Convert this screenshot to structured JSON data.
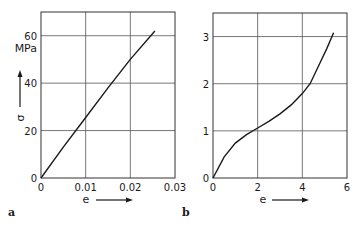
{
  "chart_data": [
    {
      "type": "line",
      "panel_label": "a",
      "title": "",
      "xlabel": "e",
      "ylabel": "σ",
      "yunit": "MPa",
      "xlim": [
        0,
        0.03
      ],
      "ylim": [
        0,
        70
      ],
      "xticks": [
        "0",
        "0.01",
        "0.02",
        "0.03"
      ],
      "yticks": [
        "0",
        "20",
        "40",
        "60"
      ],
      "grid": true,
      "x": [
        0,
        0.005,
        0.01,
        0.015,
        0.02,
        0.0255
      ],
      "y": [
        0,
        13,
        25.5,
        38,
        50,
        62
      ]
    },
    {
      "type": "line",
      "panel_label": "b",
      "title": "",
      "xlabel": "e",
      "ylabel": "",
      "xlim": [
        0,
        6
      ],
      "ylim": [
        0,
        3.5
      ],
      "xticks": [
        "0",
        "2",
        "4",
        "6"
      ],
      "yticks": [
        "0",
        "1",
        "2",
        "3"
      ],
      "grid": true,
      "x": [
        0,
        0.5,
        1.0,
        1.5,
        2.0,
        2.5,
        3.0,
        3.5,
        4.0,
        4.35,
        4.8,
        5.1,
        5.4
      ],
      "y": [
        0,
        0.45,
        0.74,
        0.92,
        1.06,
        1.2,
        1.36,
        1.55,
        1.79,
        2.0,
        2.45,
        2.75,
        3.08
      ]
    }
  ]
}
